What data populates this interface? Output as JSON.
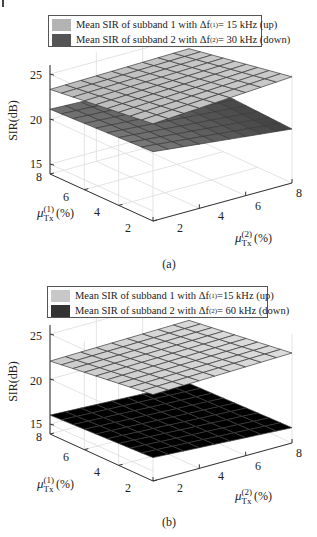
{
  "chart_data": [
    {
      "panel": "(a)",
      "type": "surface3d",
      "legend": [
        {
          "label_prefix": "Mean SIR of subband 1 with Δf",
          "sup": "(1)",
          "label_suffix": " = 15 kHz (up)",
          "color": "#b3b3b3"
        },
        {
          "label_prefix": "Mean SIR of subband 2 with Δf",
          "sup": "(2)",
          "label_suffix": " = 30 kHz (down)",
          "color": "#555555"
        }
      ],
      "zlabel": "SIR(dB)",
      "zticks": [
        "25",
        "20",
        "15"
      ],
      "x1label": {
        "sym": "μ",
        "sup": "(1)",
        "sub": "Tx",
        "unit": "(%)"
      },
      "x1ticks": [
        "8",
        "6",
        "4",
        "2"
      ],
      "x2label": {
        "sym": "μ",
        "sup": "(2)",
        "sub": "Tx",
        "unit": "(%)"
      },
      "x2ticks": [
        "2",
        "4",
        "6",
        "8"
      ],
      "zlim": [
        14,
        26
      ],
      "xlim": [
        1,
        8
      ],
      "series": [
        {
          "name": "subband 1 (up), Δf(1)=15 kHz",
          "corners": {
            "mu1max_mu2min": 23.3,
            "mu1min_mu2min": 24.7,
            "mu1min_mu2max": 25.7,
            "mu1max_mu2max": 23.6
          }
        },
        {
          "name": "subband 2 (down), Δf(2)=30 kHz",
          "corners": {
            "mu1max_mu2min": 21.1,
            "mu1min_mu2min": 21.6,
            "mu1min_mu2max": 19.9,
            "mu1max_mu2max": 20.5
          }
        }
      ],
      "caption": "(a)"
    },
    {
      "panel": "(b)",
      "type": "surface3d",
      "legend": [
        {
          "label_prefix": "Mean SIR of subband 1 with Δf",
          "sup": "(1)",
          "label_suffix": " =15 kHz (up)",
          "color": "#c8c8c8"
        },
        {
          "label_prefix": "Mean SIR of subband 2 with Δf",
          "sup": "(2)",
          "label_suffix": " = 60 kHz (down)",
          "color": "#333333"
        }
      ],
      "zlabel": "SIR(dB)",
      "zticks": [
        "25",
        "20",
        "15"
      ],
      "x1label": {
        "sym": "μ",
        "sup": "(1)",
        "sub": "Tx",
        "unit": "(%)"
      },
      "x1ticks": [
        "8",
        "6",
        "4",
        "2"
      ],
      "x2label": {
        "sym": "μ",
        "sup": "(2)",
        "sub": "Tx",
        "unit": "(%)"
      },
      "x2ticks": [
        "2",
        "4",
        "6",
        "8"
      ],
      "zlim": [
        14,
        26
      ],
      "xlim": [
        1,
        8
      ],
      "series": [
        {
          "name": "subband 1 (up), Δf(1)=15 kHz",
          "corners": {
            "mu1max_mu2min": 22.0,
            "mu1min_mu2min": 23.5,
            "mu1min_mu2max": 23.9,
            "mu1max_mu2max": 22.3
          }
        },
        {
          "name": "subband 2 (down), Δf(2)=60 kHz",
          "corners": {
            "mu1max_mu2min": 16.0,
            "mu1min_mu2min": 16.5,
            "mu1min_mu2max": 15.6,
            "mu1max_mu2max": 15.3
          }
        }
      ],
      "caption": "(b)"
    }
  ]
}
